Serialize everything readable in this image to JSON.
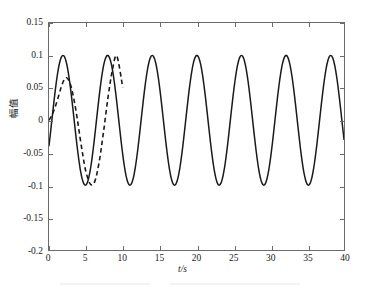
{
  "figure": {
    "background_color": "#ffffff",
    "frame_color": "#6b6b6b",
    "line_color": "#1a1a1a"
  },
  "axes": {
    "x_title": "t/s",
    "y_title": "幅值",
    "x_ticks": [
      "0",
      "5",
      "10",
      "15",
      "20",
      "25",
      "30",
      "35",
      "40"
    ],
    "y_ticks": [
      "0.15",
      "0.1",
      "0.05",
      "0",
      "-0.05",
      "-0.1",
      "-0.15",
      "-0.2"
    ]
  },
  "chart_data": {
    "type": "line",
    "title": "",
    "subtitle": "",
    "xlabel": "t/s",
    "ylabel": "幅值",
    "xlim": [
      0,
      40
    ],
    "ylim": [
      -0.2,
      0.15
    ],
    "xticks": [
      0,
      5,
      10,
      15,
      20,
      25,
      30,
      35,
      40
    ],
    "yticks": [
      0.15,
      0.1,
      0.05,
      0,
      -0.05,
      -0.1,
      -0.15,
      -0.2
    ],
    "grid": false,
    "legend": null,
    "legend_position": "none",
    "annotations": [],
    "series": [
      {
        "name": "solid-response",
        "style": "solid",
        "color": "#1a1a1a",
        "width": 1.4,
        "amplitude": 0.1,
        "period": 6.05,
        "phase_shift": 1.9,
        "x": [
          0,
          0.5,
          1,
          1.5,
          1.9,
          2.5,
          3,
          3.5,
          4,
          4.5,
          4.95,
          5.5,
          6,
          6.5,
          7,
          7.5,
          7.95,
          8.5,
          9,
          9.5,
          10,
          10.5,
          11,
          11.5,
          12,
          12.5,
          13,
          13.5,
          14,
          14.5,
          15,
          15.5,
          16,
          16.5,
          17,
          17.5,
          18,
          18.5,
          19,
          19.5,
          20,
          20.5,
          21,
          21.5,
          22,
          22.5,
          23,
          23.5,
          24,
          24.5,
          25,
          25.5,
          26,
          26.5,
          27,
          27.5,
          28,
          28.5,
          29,
          29.5,
          30,
          30.5,
          31,
          31.5,
          32,
          32.5,
          33,
          33.5,
          34,
          34.5,
          35,
          35.5,
          36,
          36.5,
          37,
          37.5,
          38,
          38.5,
          39,
          39.5,
          40
        ],
        "y": [
          0,
          0.0399,
          0.0745,
          0.0953,
          0.1,
          0.0876,
          0.0638,
          0.0299,
          -0.0099,
          -0.0488,
          -0.0793,
          -0.0989,
          -0.0963,
          -0.0731,
          -0.0346,
          0.0105,
          0.0515,
          0.0886,
          0.0999,
          0.0858,
          0.0506,
          0.0045,
          -0.0409,
          -0.0771,
          -0.0971,
          -0.0976,
          -0.0786,
          -0.0431,
          0.0016,
          0.0468,
          0.0821,
          0.0996,
          0.0955,
          0.0704,
          0.0282,
          -0.0189,
          -0.0613,
          -0.0896,
          -0.0999,
          -0.0898,
          -0.0616,
          -0.0174,
          0.0289,
          0.0703,
          0.0952,
          0.0997,
          0.0826,
          0.0462,
          0.0013,
          -0.0438,
          -0.0796,
          -0.0985,
          -0.0968,
          -0.0743,
          -0.0365,
          0.0095,
          0.0511,
          0.0872,
          0.1,
          0.0867,
          0.0524,
          0.0065,
          -0.0396,
          -0.0765,
          -0.0971,
          -0.0979,
          -0.0786,
          -0.0434,
          0.0011,
          0.0466,
          0.0819,
          0.0995,
          0.0959,
          0.071,
          0.0291,
          -0.0179,
          -0.0606,
          -0.0892,
          -0.0998,
          -0.0902,
          -0.0624
        ]
      },
      {
        "name": "dashed-response",
        "style": "dashed",
        "color": "#1a1a1a",
        "width": 1.4,
        "amplitude": 0.1,
        "period": 6.05,
        "note": "transient first peak ≈ 0.065 at t ≈ 2.3 s, converges to solid curve after t ≈ 5 s",
        "x": [
          0,
          0.4,
          0.8,
          1.2,
          1.6,
          2.0,
          2.3,
          2.6,
          3.0,
          3.4,
          3.8,
          4.2,
          4.6,
          5.0,
          5.6,
          6.2,
          6.8,
          7.4,
          8.0,
          8.6,
          9.2,
          10.0
        ],
        "y": [
          0,
          0.008,
          0.0195,
          0.0335,
          0.0492,
          0.0615,
          0.0655,
          0.0632,
          0.0516,
          0.0312,
          0.0048,
          -0.0259,
          -0.0546,
          -0.0789,
          -0.0983,
          -0.0946,
          -0.0645,
          -0.0172,
          0.0352,
          0.0776,
          0.0989,
          0.0506
        ]
      }
    ]
  }
}
